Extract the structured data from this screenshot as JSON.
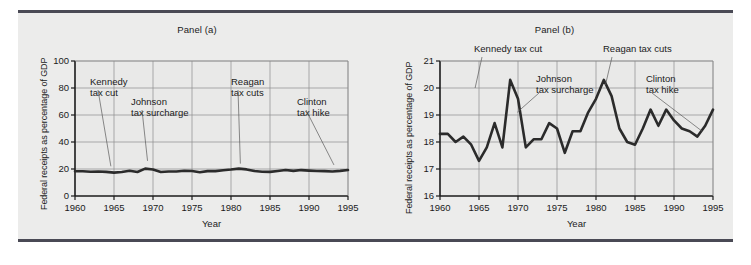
{
  "figure": {
    "background": "#ececeb",
    "rule_color": "#4a4a55",
    "text_color": "#1b1b1b",
    "series_color": "#2b2b2b",
    "grid_color": "#8d8d8d",
    "axis_color": "#1b1b1b",
    "leader_color": "#5a5a5a"
  },
  "chart_data": [
    {
      "type": "line",
      "panel": "a",
      "title": "Panel (a)",
      "xlabel": "Year",
      "ylabel": "Federal receipts as percentage of GDP",
      "xlim": [
        1960,
        1995
      ],
      "ylim": [
        0,
        100
      ],
      "xticks": [
        1960,
        1965,
        1970,
        1975,
        1980,
        1985,
        1990,
        1995
      ],
      "yticks": [
        0,
        20,
        40,
        60,
        80,
        100
      ],
      "grid": true,
      "legend": "none",
      "x": [
        1960,
        1961,
        1962,
        1963,
        1964,
        1965,
        1966,
        1967,
        1968,
        1969,
        1970,
        1971,
        1972,
        1973,
        1974,
        1975,
        1976,
        1977,
        1978,
        1979,
        1980,
        1981,
        1982,
        1983,
        1984,
        1985,
        1986,
        1987,
        1988,
        1989,
        1990,
        1991,
        1992,
        1993,
        1994,
        1995
      ],
      "values": [
        18.3,
        18.3,
        18.0,
        18.2,
        17.9,
        17.3,
        17.8,
        18.7,
        17.8,
        20.3,
        19.6,
        17.8,
        18.1,
        18.1,
        18.7,
        18.5,
        17.6,
        18.4,
        18.4,
        19.1,
        19.6,
        20.3,
        19.7,
        18.5,
        18.0,
        17.9,
        18.5,
        19.2,
        18.6,
        19.2,
        18.8,
        18.5,
        18.4,
        18.2,
        18.6,
        19.2
      ]
    },
    {
      "type": "line",
      "panel": "b",
      "title": "Panel (b)",
      "xlabel": "Year",
      "ylabel": "Federal receipts as percentage of GDP",
      "xlim": [
        1960,
        1995
      ],
      "ylim": [
        16,
        21
      ],
      "xticks": [
        1960,
        1965,
        1970,
        1975,
        1980,
        1985,
        1990,
        1995
      ],
      "yticks": [
        16,
        17,
        18,
        19,
        20,
        21
      ],
      "grid": true,
      "legend": "none",
      "x": [
        1960,
        1961,
        1962,
        1963,
        1964,
        1965,
        1966,
        1967,
        1968,
        1969,
        1970,
        1971,
        1972,
        1973,
        1974,
        1975,
        1976,
        1977,
        1978,
        1979,
        1980,
        1981,
        1982,
        1983,
        1984,
        1985,
        1986,
        1987,
        1988,
        1989,
        1990,
        1991,
        1992,
        1993,
        1994,
        1995
      ],
      "values": [
        18.3,
        18.3,
        18.0,
        18.2,
        17.9,
        17.3,
        17.8,
        18.7,
        17.8,
        20.3,
        19.6,
        17.8,
        18.1,
        18.1,
        18.7,
        18.5,
        17.6,
        18.4,
        18.4,
        19.1,
        19.6,
        20.3,
        19.7,
        18.5,
        18.0,
        17.9,
        18.5,
        19.2,
        18.6,
        19.2,
        18.8,
        18.5,
        18.4,
        18.2,
        18.6,
        19.2
      ]
    }
  ],
  "panel_a": {
    "title": "Panel (a)",
    "ylabel": "Federal receipts as percentage of GDP",
    "xlabel": "Year",
    "yticks": [
      "100",
      "80",
      "60",
      "40",
      "20",
      "0"
    ],
    "xticks": [
      "1960",
      "1965",
      "1970",
      "1975",
      "1980",
      "1985",
      "1990",
      "1995"
    ],
    "annotations": [
      {
        "id": "kennedy",
        "line1": "Kennedy",
        "line2": "tax cut"
      },
      {
        "id": "johnson",
        "line1": "Johnson",
        "line2": "tax surcharge"
      },
      {
        "id": "reagan",
        "line1": "Reagan",
        "line2": "tax cuts"
      },
      {
        "id": "clinton",
        "line1": "Clinton",
        "line2": "tax hike"
      }
    ]
  },
  "panel_b": {
    "title": "Panel (b)",
    "ylabel": "Federal receipts as percentage of GDP",
    "xlabel": "Year",
    "yticks": [
      "21",
      "20",
      "19",
      "18",
      "17",
      "16"
    ],
    "xticks": [
      "1960",
      "1965",
      "1970",
      "1975",
      "1980",
      "1985",
      "1990",
      "1995"
    ],
    "annotations": [
      {
        "id": "kennedy",
        "line1": "Kennedy tax cut",
        "line2": ""
      },
      {
        "id": "johnson",
        "line1": "Johnson",
        "line2": "tax surcharge"
      },
      {
        "id": "reagan",
        "line1": "Reagan tax cuts",
        "line2": ""
      },
      {
        "id": "clinton",
        "line1": "Clinton",
        "line2": "tax hike"
      }
    ]
  }
}
